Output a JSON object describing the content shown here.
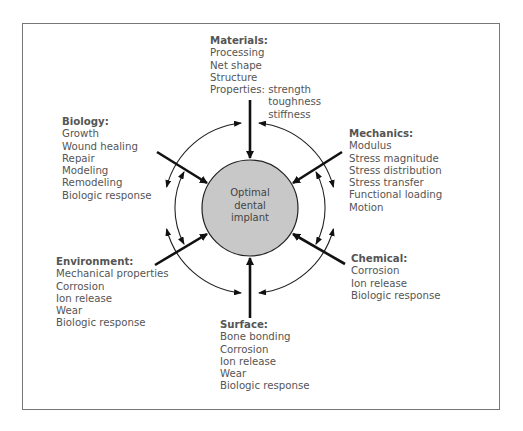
{
  "center": {
    "lines": [
      "Optimal",
      "dental",
      "implant"
    ],
    "fill": "#c8c8c8"
  },
  "materials": {
    "heading": "Materials:",
    "items": [
      "Processing",
      "Net shape",
      "Structure"
    ],
    "properties_label": "Properties:",
    "properties": [
      "strength",
      "toughness",
      "stiffness"
    ]
  },
  "mechanics": {
    "heading": "Mechanics:",
    "items": [
      "Modulus",
      "Stress magnitude",
      "Stress distribution",
      "Stress transfer",
      "Functional loading",
      "Motion"
    ]
  },
  "biology": {
    "heading": "Biology:",
    "items": [
      "Growth",
      "Wound healing",
      "Repair",
      "Modeling",
      "Remodeling",
      "Biologic response"
    ]
  },
  "chemical": {
    "heading": "Chemical:",
    "items": [
      "Corrosion",
      "Ion release",
      "Biologic response"
    ]
  },
  "environment": {
    "heading": "Environment:",
    "items": [
      "Mechanical properties",
      "Corrosion",
      "Ion release",
      "Wear",
      "Biologic response"
    ]
  },
  "surface": {
    "heading": "Surface:",
    "items": [
      "Bone bonding",
      "Corrosion",
      "Ion release",
      "Wear",
      "Biologic response"
    ]
  }
}
